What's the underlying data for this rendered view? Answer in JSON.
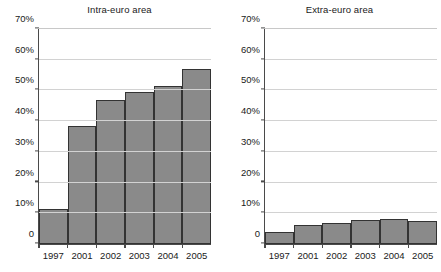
{
  "chart_data": [
    {
      "type": "bar",
      "title": "Intra-euro area",
      "xlabel": "",
      "ylabel": "",
      "categories": [
        "1997",
        "2001",
        "2002",
        "2003",
        "2004",
        "2005"
      ],
      "values": [
        11.5,
        38.3,
        47.0,
        49.5,
        51.5,
        57.0
      ],
      "ylim": [
        0,
        70
      ],
      "yticks": [
        0,
        10,
        20,
        30,
        40,
        50,
        60,
        70
      ],
      "ytick_labels": [
        "0",
        "10%",
        "20%",
        "30%",
        "40%",
        "50%",
        "60%",
        "70%"
      ],
      "grid": true,
      "legend": "none",
      "bar_color": "#8a8a8a",
      "bar_edge_color": "#333333"
    },
    {
      "type": "bar",
      "title": "Extra-euro area",
      "xlabel": "",
      "ylabel": "",
      "categories": [
        "1997",
        "2001",
        "2002",
        "2003",
        "2004",
        "2005"
      ],
      "values": [
        3.8,
        6.3,
        7.0,
        7.8,
        8.2,
        7.4
      ],
      "ylim": [
        0,
        70
      ],
      "yticks": [
        0,
        10,
        20,
        30,
        40,
        50,
        60,
        70
      ],
      "ytick_labels": [
        "0",
        "10%",
        "20%",
        "30%",
        "40%",
        "50%",
        "60%",
        "70%"
      ],
      "grid": true,
      "legend": "none",
      "bar_color": "#8a8a8a",
      "bar_edge_color": "#333333"
    }
  ]
}
